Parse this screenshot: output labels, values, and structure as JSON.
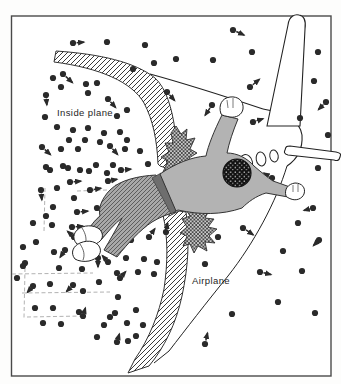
{
  "labels": {
    "inside_plane": "Inside plane",
    "airplane": "Airplane"
  },
  "colors": {
    "paper": "#fdfdfc",
    "frame": "#4a4a4a",
    "ink": "#222222",
    "dot": "#2a2a2a",
    "arrow": "#2a2a2a",
    "streamline": "#a9a9a9",
    "hatch_line": "#3a3a3a",
    "shirt": "#b3b3b3",
    "pants_base": "#a8a8a8",
    "pants_line": "#4a4a4a",
    "waistband": "#6e6e6e",
    "hair": "#111111",
    "torn_base": "#c9c9c9"
  },
  "molecules": {
    "dot_radius": 3.1,
    "inside_dots": [
      [
        107,
        42
      ],
      [
        145,
        45
      ],
      [
        154,
        63
      ],
      [
        176,
        59
      ],
      [
        213,
        60
      ],
      [
        252,
        52
      ],
      [
        133,
        69
      ],
      [
        53,
        78
      ],
      [
        61,
        87
      ],
      [
        86,
        84
      ],
      [
        97,
        83
      ],
      [
        88,
        93
      ],
      [
        45,
        117
      ],
      [
        117,
        116
      ],
      [
        127,
        110
      ],
      [
        57,
        127
      ],
      [
        73,
        130
      ],
      [
        88,
        128
      ],
      [
        104,
        133
      ],
      [
        120,
        132
      ],
      [
        69,
        140
      ],
      [
        85,
        140
      ],
      [
        100,
        142
      ],
      [
        127,
        140
      ],
      [
        140,
        151
      ],
      [
        61,
        149
      ],
      [
        78,
        149
      ],
      [
        125,
        149
      ],
      [
        46,
        167
      ],
      [
        63,
        166
      ],
      [
        80,
        170
      ],
      [
        96,
        165
      ],
      [
        113,
        165
      ],
      [
        148,
        164
      ],
      [
        50,
        170
      ],
      [
        68,
        168
      ],
      [
        89,
        171
      ],
      [
        107,
        173
      ],
      [
        57,
        188
      ],
      [
        74,
        198
      ],
      [
        53,
        207
      ],
      [
        33,
        223
      ],
      [
        52,
        225
      ],
      [
        46,
        216
      ],
      [
        36,
        242
      ],
      [
        23,
        247
      ],
      [
        54,
        252
      ],
      [
        25,
        263
      ],
      [
        126,
        258
      ],
      [
        144,
        259
      ],
      [
        157,
        262
      ],
      [
        117,
        273
      ],
      [
        138,
        272
      ],
      [
        154,
        274
      ],
      [
        23,
        266
      ],
      [
        59,
        268
      ],
      [
        82,
        269
      ],
      [
        17,
        278
      ],
      [
        50,
        284
      ],
      [
        83,
        291
      ],
      [
        99,
        282
      ],
      [
        118,
        297
      ],
      [
        115,
        313
      ],
      [
        136,
        310
      ],
      [
        35,
        308
      ],
      [
        53,
        308
      ],
      [
        79,
        312
      ],
      [
        110,
        317
      ],
      [
        43,
        323
      ],
      [
        61,
        324
      ],
      [
        104,
        325
      ],
      [
        127,
        323
      ],
      [
        143,
        325
      ],
      [
        97,
        337
      ],
      [
        128,
        341
      ],
      [
        136,
        336
      ]
    ],
    "outside_dots": [
      [
        318,
        52
      ],
      [
        314,
        81
      ],
      [
        300,
        118
      ],
      [
        328,
        135
      ],
      [
        318,
        168
      ],
      [
        298,
        223
      ],
      [
        218,
        237
      ],
      [
        283,
        251
      ],
      [
        205,
        264
      ],
      [
        302,
        271
      ],
      [
        278,
        302
      ],
      [
        232,
        314
      ],
      [
        315,
        313
      ]
    ],
    "arrows": [
      [
        73,
        43,
        86,
        42
      ],
      [
        233,
        30,
        246,
        36
      ],
      [
        63,
        74,
        74,
        84
      ],
      [
        46,
        95,
        47,
        107
      ],
      [
        108,
        99,
        117,
        109
      ],
      [
        42,
        147,
        52,
        156
      ],
      [
        110,
        146,
        119,
        156
      ],
      [
        121,
        170,
        133,
        169
      ],
      [
        70,
        182,
        83,
        181
      ],
      [
        90,
        190,
        103,
        188
      ],
      [
        108,
        181,
        119,
        179
      ],
      [
        41,
        190,
        42,
        202
      ],
      [
        77,
        212,
        90,
        211
      ],
      [
        97,
        208,
        110,
        207
      ],
      [
        72,
        227,
        85,
        226
      ],
      [
        93,
        228,
        106,
        227
      ],
      [
        74,
        237,
        66,
        230
      ],
      [
        65,
        250,
        59,
        259
      ],
      [
        101,
        223,
        108,
        216
      ],
      [
        113,
        242,
        122,
        233
      ],
      [
        131,
        240,
        133,
        228
      ],
      [
        149,
        237,
        156,
        227
      ],
      [
        166,
        232,
        168,
        221
      ],
      [
        108,
        262,
        101,
        254
      ],
      [
        98,
        258,
        98,
        269
      ],
      [
        33,
        286,
        26,
        294
      ],
      [
        73,
        285,
        65,
        293
      ],
      [
        120,
        278,
        127,
        270
      ],
      [
        83,
        316,
        86,
        306
      ],
      [
        117,
        342,
        120,
        332
      ],
      [
        167,
        92,
        176,
        102
      ],
      [
        212,
        105,
        204,
        117
      ],
      [
        250,
        87,
        261,
        78
      ],
      [
        253,
        122,
        265,
        118
      ],
      [
        326,
        102,
        317,
        111
      ],
      [
        272,
        178,
        262,
        172
      ],
      [
        313,
        208,
        302,
        211
      ],
      [
        243,
        228,
        255,
        236
      ],
      [
        319,
        240,
        312,
        247
      ],
      [
        260,
        272,
        273,
        275
      ],
      [
        205,
        344,
        208,
        331
      ]
    ]
  },
  "streamlines": [
    "77,191 107,190",
    "115,185 150,182",
    "45,188 44,232",
    "12,274 93,273",
    "25,268 24,318",
    "22,293 110,292",
    "27,317 83,316"
  ]
}
